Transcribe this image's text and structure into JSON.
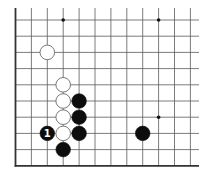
{
  "diagram": {
    "type": "go-board-fragment",
    "background": "#ffffff",
    "line_color": "#5a5a5a",
    "edge_color": "#333333",
    "grid": {
      "columns": 12,
      "rows": 10,
      "origin_x": 15.5,
      "origin_y": 20,
      "spacing_x": 15.9,
      "spacing_y": 16.2,
      "open_top_y": 8,
      "open_right_x": 199,
      "edges": [
        "left",
        "bottom"
      ]
    },
    "star_points": [
      {
        "col": 3,
        "row": 0
      },
      {
        "col": 9,
        "row": 0
      },
      {
        "col": 9,
        "row": 6
      }
    ],
    "stones": [
      {
        "color": "white",
        "col": 2,
        "row": 2,
        "label": ""
      },
      {
        "color": "white",
        "col": 3,
        "row": 4,
        "label": ""
      },
      {
        "color": "white",
        "col": 3,
        "row": 5,
        "label": ""
      },
      {
        "color": "white",
        "col": 3,
        "row": 6,
        "label": ""
      },
      {
        "color": "white",
        "col": 3,
        "row": 7,
        "label": ""
      },
      {
        "color": "black",
        "col": 4,
        "row": 5,
        "label": ""
      },
      {
        "color": "black",
        "col": 4,
        "row": 6,
        "label": ""
      },
      {
        "color": "black",
        "col": 4,
        "row": 7,
        "label": ""
      },
      {
        "color": "black",
        "col": 3,
        "row": 8,
        "label": ""
      },
      {
        "color": "black",
        "col": 2,
        "row": 7,
        "label": "1"
      },
      {
        "color": "black",
        "col": 8,
        "row": 7,
        "label": ""
      }
    ]
  }
}
